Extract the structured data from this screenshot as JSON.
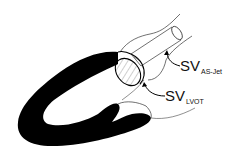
{
  "diagram": {
    "labels": [
      {
        "id": "as-jet",
        "main": "SV",
        "sub": "AS-Jet"
      },
      {
        "id": "lvot",
        "main": "SV",
        "sub": "LVOT"
      }
    ],
    "colors": {
      "myocardium": "#000000",
      "outline": "#222222",
      "background": "#ffffff",
      "hatch": "#888888"
    }
  }
}
